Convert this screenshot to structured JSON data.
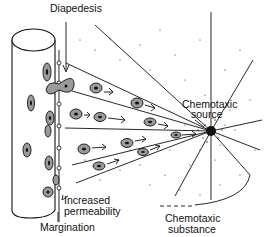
{
  "diagram": {
    "type": "biology-illustration",
    "labels": {
      "diapedesis": "Diapedesis",
      "chemotaxic_source_line1": "Chemotaxic",
      "chemotaxic_source_line2": "source",
      "increased_permeability_line1": "Increased",
      "increased_permeability_line2": "permeability",
      "margination": "Margination",
      "chemotaxic_substance_line1": "Chemotaxic",
      "chemotaxic_substance_line2": "substance"
    },
    "elements": {
      "blood_vessel": "cylinder on left with leukocytes inside",
      "migrating_cells": 10,
      "source_point": "black dot with radiating lines",
      "stipple": "dots indicating gradient of chemotaxic substance"
    },
    "colors": {
      "ink": "#111111",
      "cell_fill": "#9a9a9a",
      "background": "#ffffff"
    }
  }
}
